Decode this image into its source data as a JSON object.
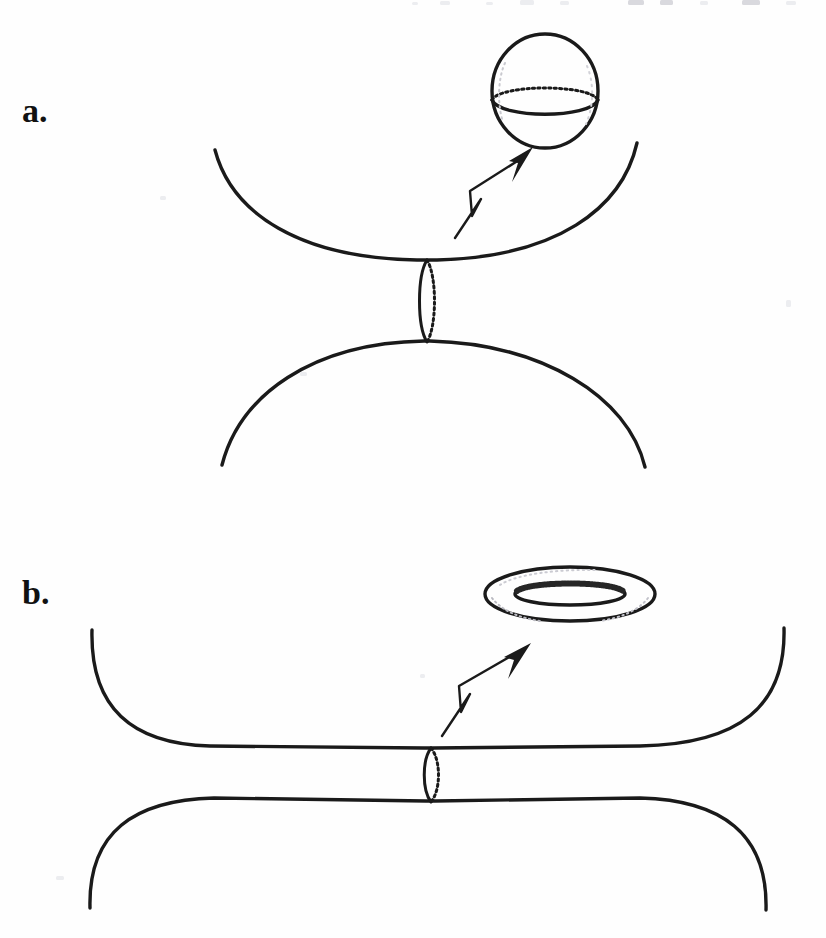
{
  "document": {
    "kind": "scanned-textbook-figure",
    "caption_absent": true,
    "background_color": "#fefefe",
    "ink_color": "#1a1a1a",
    "width": 826,
    "height": 938
  },
  "panels": [
    {
      "id": "a",
      "label": "a.",
      "label_x": 22,
      "label_y": 122,
      "description_parts": [
        "upper-bowl-surface",
        "lower-dome-surface",
        "connecting-neck-tube",
        "callout-arrow",
        "sphere-inset"
      ],
      "inset_shape": "sphere",
      "inset": {
        "name": "sphere",
        "cx": 545,
        "cy": 91,
        "rx": 53,
        "ry": 57,
        "equator_cy": 101,
        "equator_rx": 53,
        "equator_ry": 14
      },
      "arrow": {
        "tail_x": 455,
        "tail_y": 238,
        "tip_x": 531,
        "tip_y": 148,
        "zig_x": 479,
        "zig_y": 197
      },
      "neck": {
        "cx": 427,
        "cy": 301,
        "rx": 9,
        "ry": 41
      }
    },
    {
      "id": "b",
      "label": "b.",
      "label_x": 22,
      "label_y": 604,
      "description_parts": [
        "upper-flattened-surface",
        "lower-flattened-surface",
        "connecting-neck-tube",
        "callout-arrow",
        "torus-inset"
      ],
      "inset_shape": "torus",
      "inset": {
        "name": "torus",
        "cx": 570,
        "cy": 594,
        "outer_rx": 85,
        "outer_ry": 27,
        "inner_rx": 55,
        "inner_ry": 11
      },
      "arrow": {
        "tail_x": 442,
        "tail_y": 736,
        "tip_x": 529,
        "tip_y": 644,
        "zig_x": 469,
        "zig_y": 692
      },
      "neck": {
        "cx": 432,
        "cy": 771,
        "rx": 9,
        "ry": 31
      }
    }
  ],
  "icons": {
    "sphere": "sphere-icon",
    "torus": "torus-icon",
    "arrow": "callout-arrow-icon",
    "neck": "neck-tube-icon"
  }
}
